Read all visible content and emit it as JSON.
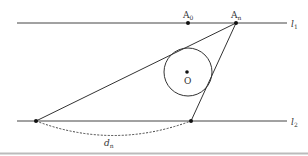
{
  "diagram": {
    "lines": {
      "l1": {
        "label": "l",
        "subscript": "1",
        "y": 23
      },
      "l2": {
        "label": "l",
        "subscript": "2",
        "y": 121
      }
    },
    "points": {
      "A0": {
        "label": "A",
        "subscript": "0",
        "x": 188,
        "y": 23
      },
      "An": {
        "label": "A",
        "subscript": "n",
        "x": 236,
        "y": 23
      },
      "O": {
        "label": "O",
        "x": 187,
        "y": 72
      },
      "B_left": {
        "x": 36,
        "y": 121
      },
      "B_right": {
        "x": 191,
        "y": 121
      }
    },
    "circle": {
      "cx": 188,
      "cy": 72,
      "r": 24
    },
    "distance": {
      "label": "d",
      "subscript": "n"
    },
    "colors": {
      "stroke": "#333333",
      "background": "#ffffff",
      "border": "#bbbbbb"
    }
  }
}
